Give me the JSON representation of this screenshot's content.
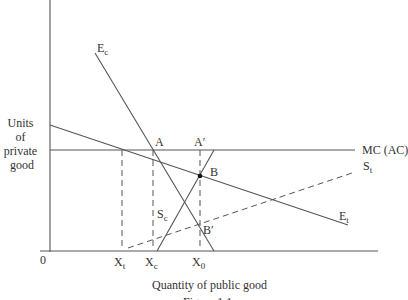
{
  "figure": {
    "y_axis_label_lines": [
      "Units",
      "of",
      "private",
      "good"
    ],
    "x_axis_label": "Quantity of public good",
    "origin_label": "0",
    "caption": "Figure 1.1"
  },
  "curves": {
    "Ec": {
      "main": "E",
      "sub": "c"
    },
    "Et": {
      "main": "E",
      "sub": "t"
    },
    "Sc": {
      "main": "S",
      "sub": "c"
    },
    "St": {
      "main": "S",
      "sub": "t"
    },
    "MC": {
      "label": "MC (AC)"
    }
  },
  "points": {
    "A": "A",
    "A_prime": "A′",
    "B": "B",
    "B_prime": "B′"
  },
  "x_ticks": {
    "Xt": {
      "main": "X",
      "sub": "t"
    },
    "Xc": {
      "main": "X",
      "sub": "c"
    },
    "X0": {
      "main": "X",
      "sub": "0"
    }
  }
}
